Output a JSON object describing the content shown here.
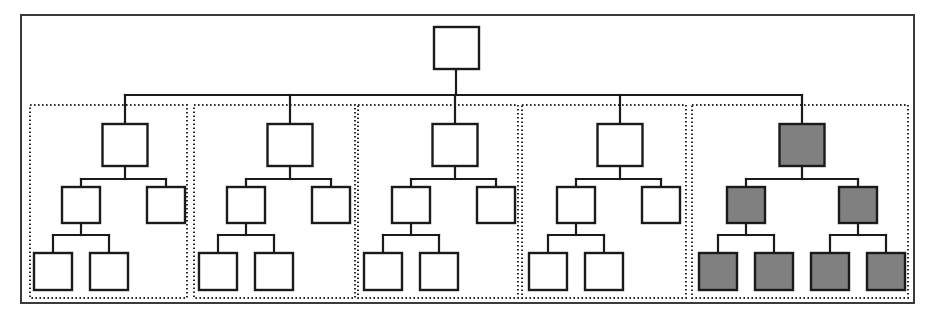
{
  "figure": {
    "type": "hierarchy-tree-diagram",
    "title": "",
    "width": 931,
    "height": 321,
    "background_color": "#ffffff"
  },
  "colors": {
    "node_stroke": "#1a1a1a",
    "node_fill_plain": "#ffffff",
    "node_fill_highlight": "#808080",
    "outer_frame_stroke": "#3a3a3a",
    "group_box_stroke": "#2b2b2b",
    "connector_stroke": "#1a1a1a"
  },
  "outer_frame": {
    "label": "",
    "x": 20,
    "y": 14,
    "width": 893,
    "height": 288
  },
  "root": {
    "label": "",
    "highlighted": false,
    "x": 434,
    "y": 27,
    "width": 45,
    "height": 42
  },
  "trunk": {
    "from_y": 69,
    "bus_y": 95,
    "bus_x_start": 125,
    "bus_x_end": 802,
    "root_center_x": 456
  },
  "group_geometry": {
    "y": 105,
    "height": 193,
    "boxes": [
      {
        "x": 30,
        "width": 157
      },
      {
        "x": 194,
        "width": 161
      },
      {
        "x": 358,
        "width": 160
      },
      {
        "x": 522,
        "width": 164
      },
      {
        "x": 692,
        "width": 216
      }
    ]
  },
  "node_size": {
    "level1_w": 45,
    "level1_h": 42,
    "level2_w": 38,
    "level2_h": 36,
    "level3_w": 38,
    "level3_h": 37
  },
  "rows": {
    "level1_y": 124,
    "level2_y": 187,
    "level3_y": 253
  },
  "groups": [
    {
      "id": "group-1",
      "label": "",
      "highlighted": false,
      "node_count": 5,
      "shape": "left-heavy",
      "center_x": 125,
      "nodes": [
        {
          "id": "g1-n1",
          "level": 1,
          "label": "",
          "highlighted": false,
          "cx": 125
        },
        {
          "id": "g1-n2",
          "level": 2,
          "label": "",
          "highlighted": false,
          "cx": 81
        },
        {
          "id": "g1-n3",
          "level": 2,
          "label": "",
          "highlighted": false,
          "cx": 166
        },
        {
          "id": "g1-n4",
          "level": 3,
          "label": "",
          "highlighted": false,
          "cx": 53
        },
        {
          "id": "g1-n5",
          "level": 3,
          "label": "",
          "highlighted": false,
          "cx": 109
        }
      ]
    },
    {
      "id": "group-2",
      "label": "",
      "highlighted": false,
      "node_count": 5,
      "shape": "left-heavy",
      "center_x": 290,
      "nodes": [
        {
          "id": "g2-n1",
          "level": 1,
          "label": "",
          "highlighted": false,
          "cx": 290
        },
        {
          "id": "g2-n2",
          "level": 2,
          "label": "",
          "highlighted": false,
          "cx": 246
        },
        {
          "id": "g2-n3",
          "level": 2,
          "label": "",
          "highlighted": false,
          "cx": 331
        },
        {
          "id": "g2-n4",
          "level": 3,
          "label": "",
          "highlighted": false,
          "cx": 218
        },
        {
          "id": "g2-n5",
          "level": 3,
          "label": "",
          "highlighted": false,
          "cx": 274
        }
      ]
    },
    {
      "id": "group-3",
      "label": "",
      "highlighted": false,
      "node_count": 5,
      "shape": "left-heavy",
      "center_x": 455,
      "nodes": [
        {
          "id": "g3-n1",
          "level": 1,
          "label": "",
          "highlighted": false,
          "cx": 455
        },
        {
          "id": "g3-n2",
          "level": 2,
          "label": "",
          "highlighted": false,
          "cx": 411
        },
        {
          "id": "g3-n3",
          "level": 2,
          "label": "",
          "highlighted": false,
          "cx": 496
        },
        {
          "id": "g3-n4",
          "level": 3,
          "label": "",
          "highlighted": false,
          "cx": 383
        },
        {
          "id": "g3-n5",
          "level": 3,
          "label": "",
          "highlighted": false,
          "cx": 439
        }
      ]
    },
    {
      "id": "group-4",
      "label": "",
      "highlighted": false,
      "node_count": 5,
      "shape": "left-heavy",
      "center_x": 620,
      "nodes": [
        {
          "id": "g4-n1",
          "level": 1,
          "label": "",
          "highlighted": false,
          "cx": 620
        },
        {
          "id": "g4-n2",
          "level": 2,
          "label": "",
          "highlighted": false,
          "cx": 576
        },
        {
          "id": "g4-n3",
          "level": 2,
          "label": "",
          "highlighted": false,
          "cx": 661
        },
        {
          "id": "g4-n4",
          "level": 3,
          "label": "",
          "highlighted": false,
          "cx": 548
        },
        {
          "id": "g4-n5",
          "level": 3,
          "label": "",
          "highlighted": false,
          "cx": 604
        }
      ]
    },
    {
      "id": "group-5",
      "label": "",
      "highlighted": true,
      "node_count": 7,
      "shape": "full-binary",
      "center_x": 802,
      "nodes": [
        {
          "id": "g5-n1",
          "level": 1,
          "label": "",
          "highlighted": true,
          "cx": 802
        },
        {
          "id": "g5-n2",
          "level": 2,
          "label": "",
          "highlighted": true,
          "cx": 746
        },
        {
          "id": "g5-n3",
          "level": 2,
          "label": "",
          "highlighted": true,
          "cx": 858
        },
        {
          "id": "g5-n4",
          "level": 3,
          "label": "",
          "highlighted": true,
          "cx": 718
        },
        {
          "id": "g5-n5",
          "level": 3,
          "label": "",
          "highlighted": true,
          "cx": 774
        },
        {
          "id": "g5-n6",
          "level": 3,
          "label": "",
          "highlighted": true,
          "cx": 830
        },
        {
          "id": "g5-n7",
          "level": 3,
          "label": "",
          "highlighted": true,
          "cx": 886
        }
      ]
    }
  ],
  "summary": {
    "total_groups": 5,
    "highlighted_groups": 1,
    "plain_groups": 4,
    "total_nodes": 28,
    "highlighted_nodes": 7
  }
}
